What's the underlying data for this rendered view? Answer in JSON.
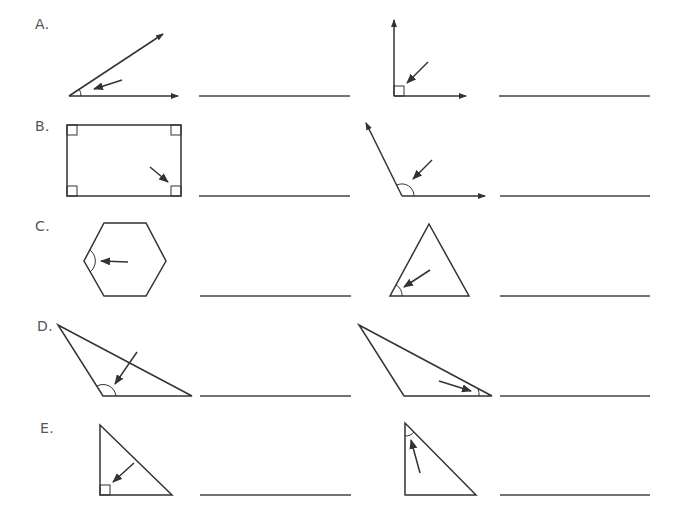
{
  "worksheet": {
    "rows": [
      {
        "label": "A.",
        "x": 35,
        "y": 16
      },
      {
        "label": "B.",
        "x": 35,
        "y": 118
      },
      {
        "label": "C.",
        "x": 35,
        "y": 218
      },
      {
        "label": "D.",
        "x": 37,
        "y": 318
      },
      {
        "label": "E.",
        "x": 40,
        "y": 420
      }
    ],
    "answer_lines": [
      {
        "id": "A1",
        "x1": 199,
        "x2": 350,
        "y": 96
      },
      {
        "id": "A2",
        "x1": 499,
        "x2": 650,
        "y": 96
      },
      {
        "id": "B1",
        "x1": 199,
        "x2": 350,
        "y": 196
      },
      {
        "id": "B2",
        "x1": 500,
        "x2": 650,
        "y": 196
      },
      {
        "id": "C1",
        "x1": 200,
        "x2": 351,
        "y": 296
      },
      {
        "id": "C2",
        "x1": 500,
        "x2": 650,
        "y": 296
      },
      {
        "id": "D1",
        "x1": 200,
        "x2": 351,
        "y": 396
      },
      {
        "id": "D2",
        "x1": 500,
        "x2": 650,
        "y": 396
      },
      {
        "id": "E1",
        "x1": 200,
        "x2": 351,
        "y": 495
      },
      {
        "id": "E2",
        "x1": 500,
        "x2": 650,
        "y": 495
      }
    ],
    "figures": [
      {
        "id": "A1",
        "type": "acute-angle",
        "angle_mark": "arc"
      },
      {
        "id": "A2",
        "type": "right-angle",
        "angle_mark": "square"
      },
      {
        "id": "B1",
        "type": "rectangle",
        "angle_mark": "square"
      },
      {
        "id": "B2",
        "type": "obtuse-angle",
        "angle_mark": "arc"
      },
      {
        "id": "C1",
        "type": "hexagon",
        "angle_mark": "arc"
      },
      {
        "id": "C2",
        "type": "equilateral-triangle",
        "angle_mark": "arc"
      },
      {
        "id": "D1",
        "type": "obtuse-triangle",
        "angle_mark": "arc"
      },
      {
        "id": "D2",
        "type": "obtuse-triangle",
        "angle_mark": "arc"
      },
      {
        "id": "E1",
        "type": "right-triangle",
        "angle_mark": "square"
      },
      {
        "id": "E2",
        "type": "right-triangle",
        "angle_mark": "arc"
      }
    ],
    "colors": {
      "stroke": "#333333",
      "label": "#555555",
      "background": "#ffffff"
    }
  }
}
